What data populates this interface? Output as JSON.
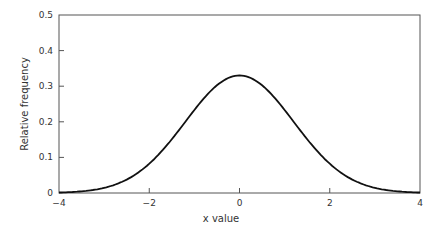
{
  "chart_data": {
    "type": "line",
    "title": "",
    "xlabel": "x value",
    "ylabel": "Relative frequency",
    "xlim": [
      -4,
      4
    ],
    "ylim": [
      0,
      0.5
    ],
    "x_ticks": [
      "−4",
      "−2",
      "0",
      "2",
      "4"
    ],
    "y_ticks": [
      "0",
      "0.1",
      "0.2",
      "0.3",
      "0.4",
      "0.5"
    ],
    "grid": false,
    "legend": null,
    "series": [
      {
        "name": "normal curve",
        "x": [
          -4,
          -3.5,
          -3,
          -2.5,
          -2,
          -1.5,
          -1,
          -0.5,
          0,
          0.5,
          1,
          1.5,
          2,
          2.5,
          3,
          3.5,
          4
        ],
        "values": [
          0.001,
          0.005,
          0.015,
          0.038,
          0.08,
          0.138,
          0.21,
          0.28,
          0.33,
          0.28,
          0.21,
          0.138,
          0.08,
          0.038,
          0.015,
          0.005,
          0.001
        ]
      }
    ]
  }
}
